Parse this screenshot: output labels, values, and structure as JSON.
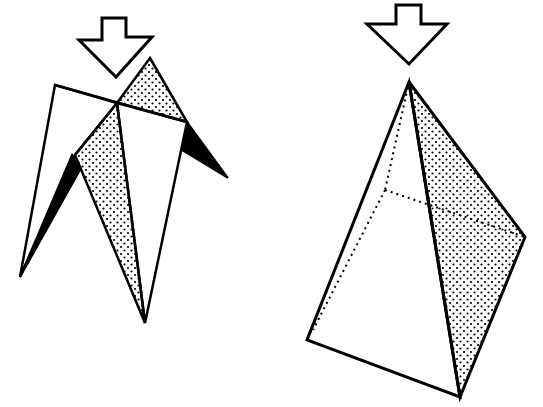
{
  "diagram": {
    "type": "origami-fold-steps",
    "background": "#ffffff",
    "ink": "#000000",
    "steps": [
      {
        "id": "step-left",
        "description": "Partially folded model with push-down arrow, shaded dotted faces and black inner flaps"
      },
      {
        "id": "step-right",
        "description": "Resulting pyramid/tetrahedral form with push-down arrow, dotted hidden edges and shaded side face"
      }
    ],
    "icons": [
      "push-down-arrow-icon",
      "push-down-arrow-icon"
    ]
  }
}
